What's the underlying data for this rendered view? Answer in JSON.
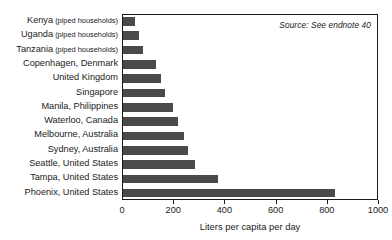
{
  "chart_data": {
    "type": "bar",
    "orientation": "horizontal",
    "title": "",
    "xlabel": "Liters per capita per day",
    "ylabel": "",
    "xlim": [
      0,
      1000
    ],
    "xticks": [
      0,
      200,
      400,
      600,
      800,
      1000
    ],
    "xtick_labels": [
      "0",
      "200",
      "400",
      "600",
      "800",
      "1000"
    ],
    "grid": false,
    "legend": null,
    "bar_color": "#4a4a4a",
    "frame_color": "#1a1a1a",
    "background": "#ffffff",
    "annotations": [
      {
        "name": "source-note",
        "text": "Source: See endnote 40",
        "position": "top-right",
        "style": "italic"
      }
    ],
    "categories": [
      "Kenya (piped households)",
      "Uganda (piped households)",
      "Tanzania (piped households)",
      "Copenhagen, Denmark",
      "United Kingdom",
      "Singapore",
      "Manila, Philippines",
      "Waterloo, Canada",
      "Melbourne, Australia",
      "Sydney, Australia",
      "Seattle, United States",
      "Tampa, United States",
      "Phoenix, United States"
    ],
    "values": [
      45,
      62,
      80,
      130,
      150,
      165,
      195,
      215,
      240,
      255,
      280,
      370,
      830
    ],
    "bars": [
      {
        "main": "Kenya",
        "sub": " (piped households)",
        "value": 45
      },
      {
        "main": "Uganda",
        "sub": " (piped households)",
        "value": 62
      },
      {
        "main": "Tanzania",
        "sub": " (piped households)",
        "value": 80
      },
      {
        "main": "Copenhagen, Denmark",
        "sub": "",
        "value": 130
      },
      {
        "main": "United Kingdom",
        "sub": "",
        "value": 150
      },
      {
        "main": "Singapore",
        "sub": "",
        "value": 165
      },
      {
        "main": "Manila, Philippines",
        "sub": "",
        "value": 195
      },
      {
        "main": "Waterloo, Canada",
        "sub": "",
        "value": 215
      },
      {
        "main": "Melbourne, Australia",
        "sub": "",
        "value": 240
      },
      {
        "main": "Sydney, Australia",
        "sub": "",
        "value": 255
      },
      {
        "main": "Seattle, United States",
        "sub": "",
        "value": 280
      },
      {
        "main": "Tampa, United States",
        "sub": "",
        "value": 370
      },
      {
        "main": "Phoenix, United States",
        "sub": "",
        "value": 830
      }
    ]
  }
}
